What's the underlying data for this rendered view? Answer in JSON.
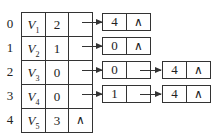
{
  "diagram": {
    "type": "adjacency-list",
    "vertices": [
      {
        "index": "0",
        "name": "V",
        "sub": "1",
        "in_degree": "2",
        "first_arc": "pointer"
      },
      {
        "index": "1",
        "name": "V",
        "sub": "2",
        "in_degree": "1",
        "first_arc": "pointer"
      },
      {
        "index": "2",
        "name": "V",
        "sub": "3",
        "in_degree": "0",
        "first_arc": "pointer"
      },
      {
        "index": "3",
        "name": "V",
        "sub": "4",
        "in_degree": "0",
        "first_arc": "pointer"
      },
      {
        "index": "4",
        "name": "V",
        "sub": "5",
        "in_degree": "3",
        "first_arc": "∧"
      }
    ],
    "arc_lists": [
      {
        "row": 0,
        "nodes": [
          {
            "adjvex": "4",
            "next": "∧"
          }
        ]
      },
      {
        "row": 1,
        "nodes": [
          {
            "adjvex": "0",
            "next": "∧"
          }
        ]
      },
      {
        "row": 2,
        "nodes": [
          {
            "adjvex": "0",
            "next": "pointer"
          },
          {
            "adjvex": "4",
            "next": "∧"
          }
        ]
      },
      {
        "row": 3,
        "nodes": [
          {
            "adjvex": "1",
            "next": "pointer"
          },
          {
            "adjvex": "4",
            "next": "∧"
          }
        ]
      }
    ],
    "null_symbol": "∧",
    "line_color": "#333333"
  }
}
